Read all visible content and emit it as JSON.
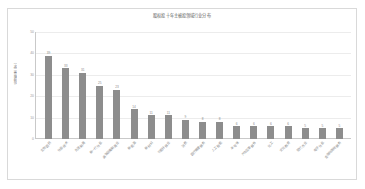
{
  "chart": {
    "title": "股权投十年主被投领域行业分布",
    "y_axis_title": "投资数量（家）",
    "border_color": "#d9d9d9",
    "bar_color": "#8d8d8d",
    "gridline_color": "#ececec",
    "axis_color": "#c9c9c9",
    "label_color": "#8a8a8a"
  },
  "chart_data": {
    "type": "bar",
    "title": "股权投十年主被投领域行业分布",
    "xlabel": "",
    "ylabel": "投资数量（家）",
    "ylim": [
      0,
      50
    ],
    "yticks": [
      0,
      10,
      20,
      30,
      40,
      50
    ],
    "grid": true,
    "legend": "none",
    "orientation": "vertical",
    "data_labels": true,
    "xtick_rotation": -45,
    "categories": [
      "生物医药",
      "信息技术",
      "先进制造",
      "新一代信息",
      "高端装备制造业",
      "新能源",
      "新材料",
      "节能环保业",
      "消费",
      "医疗健康服务",
      "人工智能",
      "半导体",
      "汽车及零部件",
      "化工",
      "文化教育",
      "现代农业",
      "电子信息",
      "金融与其他服务"
    ],
    "values": [
      39,
      33,
      31,
      25,
      23,
      14,
      11,
      11,
      9,
      8,
      8,
      6,
      6,
      6,
      6,
      5,
      5,
      5
    ],
    "series": [
      {
        "name": "投资数量（家）",
        "values": [
          39,
          33,
          31,
          25,
          23,
          14,
          11,
          11,
          9,
          8,
          8,
          6,
          6,
          6,
          6,
          5,
          5,
          5
        ]
      }
    ]
  }
}
